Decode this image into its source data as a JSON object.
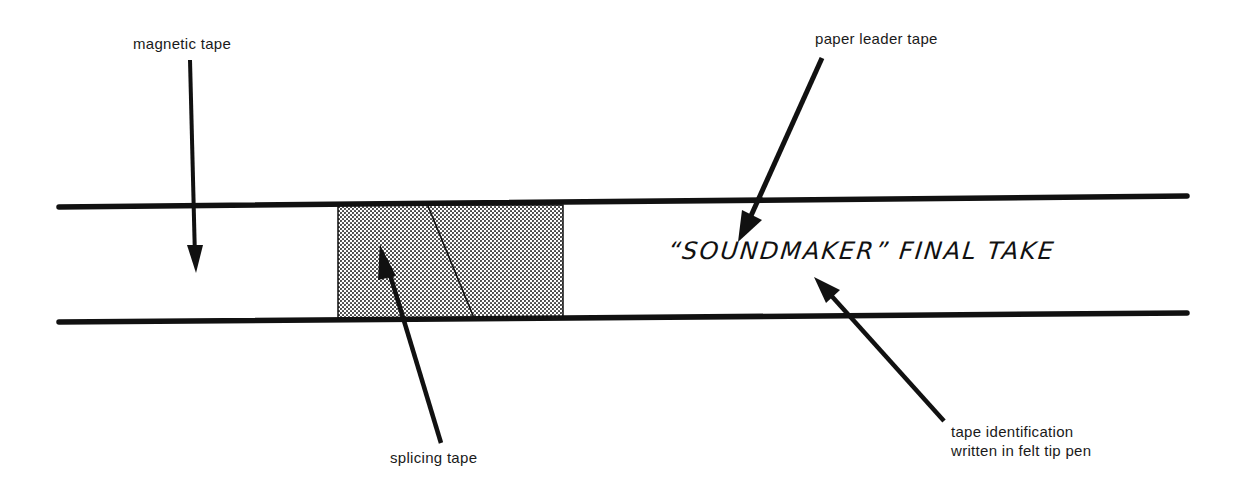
{
  "diagram": {
    "title": "",
    "labels": {
      "magnetic_tape": "magnetic tape",
      "paper_leader_tape": "paper leader tape",
      "splicing_tape": "splicing tape",
      "tape_id_line1": "tape identification",
      "tape_id_line2": "written in felt tip pen"
    },
    "handwritten_text": "“SOUNDMAKER” FINAL TAKE",
    "colors": {
      "ink": "#111111",
      "splice_fill": "#c8c8c8",
      "background": "#ffffff"
    }
  }
}
